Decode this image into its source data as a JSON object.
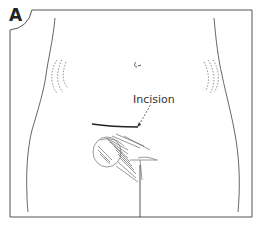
{
  "figure": {
    "panel_label": "A",
    "callout_label": "Incision",
    "colors": {
      "ink": "#333333",
      "frame": "#555555",
      "background": "#ffffff"
    }
  }
}
